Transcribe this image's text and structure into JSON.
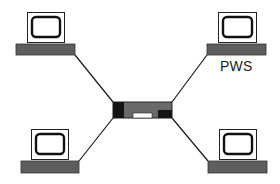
{
  "diagram": {
    "type": "star-network",
    "colors": {
      "line": "#1a1a1a",
      "base": "#5e5e5e",
      "hub_body": "#6a6a6a",
      "hub_ends": "#151515",
      "hub_slot": "#ffffff",
      "background": "#ffffff"
    },
    "hub": {
      "name": "hub",
      "x": 113,
      "y": 102,
      "w": 59,
      "h": 16
    },
    "nodes": [
      {
        "id": "top-left",
        "label": "",
        "monitor": {
          "x": 27,
          "y": 12,
          "w": 37,
          "h": 30
        },
        "base": {
          "x": 16,
          "y": 44,
          "w": 59,
          "h": 11
        },
        "link": {
          "x1": 75,
          "y1": 55,
          "x2": 113,
          "y2": 102
        }
      },
      {
        "id": "top-right",
        "label": "PWS",
        "monitor": {
          "x": 218,
          "y": 12,
          "w": 38,
          "h": 30
        },
        "base": {
          "x": 207,
          "y": 44,
          "w": 59,
          "h": 11
        },
        "link": {
          "x1": 207,
          "y1": 55,
          "x2": 172,
          "y2": 102
        }
      },
      {
        "id": "bottom-left",
        "label": "",
        "monitor": {
          "x": 31,
          "y": 129,
          "w": 37,
          "h": 30
        },
        "base": {
          "x": 21,
          "y": 161,
          "w": 58,
          "h": 12
        },
        "link": {
          "x1": 79,
          "y1": 161,
          "x2": 113,
          "y2": 118
        }
      },
      {
        "id": "bottom-right",
        "label": "",
        "monitor": {
          "x": 219,
          "y": 129,
          "w": 37,
          "h": 30
        },
        "base": {
          "x": 208,
          "y": 161,
          "w": 59,
          "h": 12
        },
        "link": {
          "x1": 208,
          "y1": 161,
          "x2": 172,
          "y2": 118
        }
      }
    ],
    "labels": {
      "pws": "PWS"
    }
  }
}
